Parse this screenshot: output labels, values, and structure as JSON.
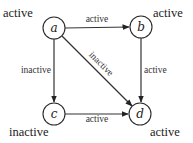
{
  "diagram": {
    "nodes": [
      {
        "id": "a",
        "label": "a",
        "state": "active"
      },
      {
        "id": "b",
        "label": "b",
        "state": "active"
      },
      {
        "id": "c",
        "label": "c",
        "state": "inactive"
      },
      {
        "id": "d",
        "label": "d",
        "state": "active"
      }
    ],
    "edges": [
      {
        "from": "a",
        "to": "b",
        "label": "active"
      },
      {
        "from": "a",
        "to": "c",
        "label": "inactive"
      },
      {
        "from": "a",
        "to": "d",
        "label": "inactive"
      },
      {
        "from": "b",
        "to": "d",
        "label": "active"
      },
      {
        "from": "c",
        "to": "d",
        "label": "active"
      }
    ]
  }
}
